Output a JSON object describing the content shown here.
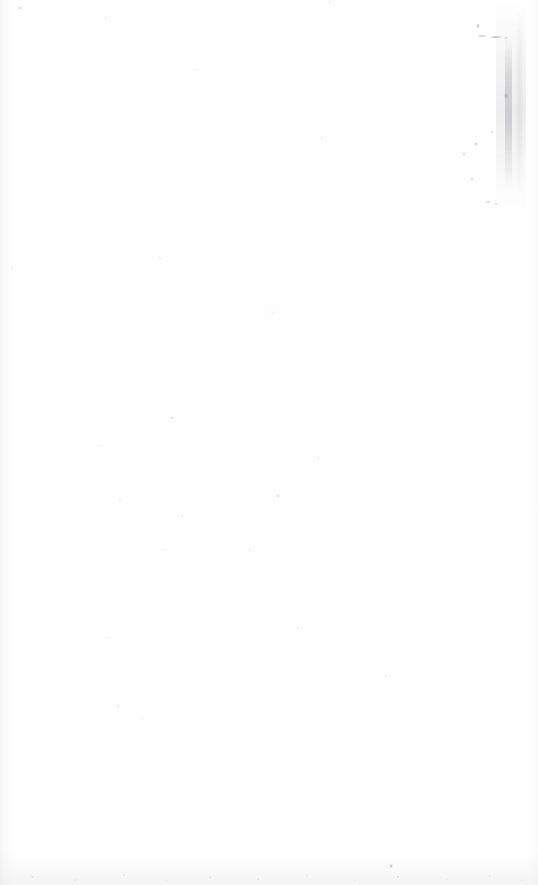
{
  "page": {
    "kind": "scanned-blank-page",
    "width": 538,
    "height": 885,
    "background_color": "#ffffff",
    "visible_text": "",
    "has_legible_text": false
  },
  "artifacts": {
    "label": "",
    "items": [
      {
        "name": "vertical-smudge-streak",
        "region": "upper-right-margin",
        "x": 496,
        "y": 0,
        "width": 30,
        "height": 212,
        "color": "#787880"
      },
      {
        "name": "illegible-ink-marks",
        "region": "upper-right-margin",
        "x": 452,
        "y": 14,
        "width": 82,
        "height": 200,
        "color": "#6e6e76"
      },
      {
        "name": "left-edge-shadow",
        "region": "left-margin",
        "x": 0,
        "y": 0,
        "width": 14,
        "height": 885,
        "color": "#969698"
      },
      {
        "name": "right-edge-shadow",
        "region": "right-margin",
        "x": 528,
        "y": 0,
        "width": 10,
        "height": 885,
        "color": "#a0a0a2"
      },
      {
        "name": "bottom-speckle-band",
        "region": "bottom-margin",
        "x": 0,
        "y": 851,
        "width": 538,
        "height": 34,
        "color": "#787880"
      },
      {
        "name": "dust-speck-field",
        "region": "page-body",
        "x": 0,
        "y": 0,
        "width": 538,
        "height": 885,
        "color": "#b0b0b6"
      },
      {
        "name": "dark-speck",
        "region": "lower-center-right",
        "x": 391,
        "y": 866,
        "width": 2,
        "height": 2,
        "color": "#78787e"
      }
    ]
  }
}
